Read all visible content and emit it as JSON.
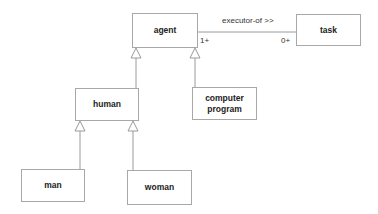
{
  "diagram": {
    "type": "uml-class-diagram",
    "colors": {
      "border": "#a8a8a8",
      "line": "#9a9a9a",
      "text": "#222222",
      "background": "#ffffff"
    },
    "nodes": {
      "agent": {
        "label": "agent"
      },
      "task": {
        "label": "task"
      },
      "human": {
        "label": "human"
      },
      "computer_program": {
        "label_line1": "computer",
        "label_line2": "program"
      },
      "man": {
        "label": "man"
      },
      "woman": {
        "label": "woman"
      }
    },
    "association": {
      "name": "executor-of >>",
      "source_multiplicity": "1+",
      "target_multiplicity": "0+",
      "from": "agent",
      "to": "task"
    },
    "generalizations": [
      {
        "child": "human",
        "parent": "agent"
      },
      {
        "child": "computer program",
        "parent": "agent"
      },
      {
        "child": "man",
        "parent": "human"
      },
      {
        "child": "woman",
        "parent": "human"
      }
    ]
  }
}
